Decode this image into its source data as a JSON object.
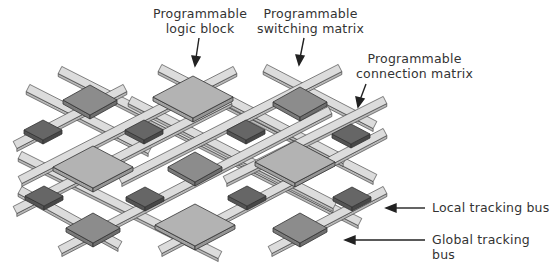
{
  "labels": {
    "logic_block": {
      "line1": "Programmable",
      "line2": "logic block"
    },
    "switching_matrix": {
      "line1": "Programmable",
      "line2": "switching matrix"
    },
    "connection_matrix": {
      "line1": "Programmable",
      "line2": "connection matrix"
    },
    "local_bus": "Local tracking bus",
    "global_bus": "Global tracking bus"
  },
  "colors": {
    "logic_block_top": "#b3b3b3",
    "switch_top": "#8c8c8c",
    "connection_top": "#666666",
    "track_fill": "#dcdcdc",
    "outline": "#333333",
    "text": "#333333"
  },
  "components": {
    "logic_blocks": [
      [
        193,
        97
      ],
      [
        93,
        167
      ],
      [
        295,
        162
      ],
      [
        195,
        225
      ]
    ],
    "switching_matrices": [
      [
        90,
        100
      ],
      [
        300,
        102
      ],
      [
        195,
        167
      ],
      [
        93,
        228
      ],
      [
        300,
        228
      ]
    ],
    "connection_matrices": [
      [
        43,
        130
      ],
      [
        144,
        130
      ],
      [
        246,
        130
      ],
      [
        351,
        134
      ],
      [
        44,
        196
      ],
      [
        145,
        197
      ],
      [
        247,
        196
      ],
      [
        352,
        197
      ]
    ]
  }
}
